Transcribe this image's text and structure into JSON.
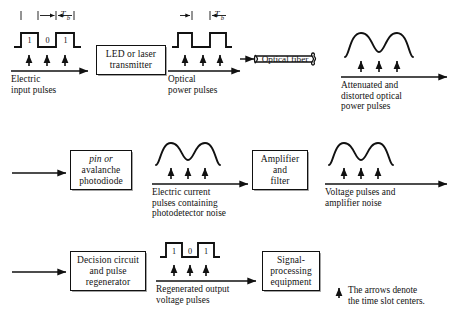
{
  "figure": {
    "note_text": "The arrows denote\nthe time slot centers.",
    "note_icon": "up-arrow-icon",
    "period_symbol": "T",
    "period_subscript": "b"
  },
  "stages": {
    "electric_input": {
      "caption": "Electric\ninput pulses",
      "bits": [
        "1",
        "0",
        "1"
      ],
      "waveform": "square-pulse-train",
      "has_bit_labels": true,
      "has_period_marker": true
    },
    "transmitter_box": {
      "label_lines": [
        "LED or laser",
        "transmitter"
      ]
    },
    "optical_power": {
      "caption": "Optical\npower pulses",
      "bits": [
        "",
        "",
        ""
      ],
      "waveform": "square-pulse-train",
      "has_bit_labels": false,
      "has_period_marker": true
    },
    "optical_fiber": {
      "label": "Optical fiber",
      "shape": "cylinder"
    },
    "attenuated_optical": {
      "caption": "Attenuated and\ndistorted optical\npower pulses",
      "waveform": "rounded-humps"
    },
    "photodiode_box": {
      "label_lines": [
        "pin or",
        "avalanche",
        "photodiode"
      ],
      "italic_word": "pin"
    },
    "electric_current": {
      "caption": "Electric current\npulses containing\nphotodetector noise",
      "waveform": "rounded-humps"
    },
    "amplifier_box": {
      "label_lines": [
        "Amplifier",
        "and",
        "filter"
      ]
    },
    "voltage_pulses": {
      "caption": "Voltage pulses and\namplifier noise",
      "waveform": "rounded-humps"
    },
    "decision_box": {
      "label_lines": [
        "Decision circuit",
        "and pulse",
        "regenerator"
      ]
    },
    "regenerated_output": {
      "caption": "Regenerated output\nvoltage pulses",
      "bits": [
        "1",
        "0",
        "1"
      ],
      "waveform": "square-pulse-train",
      "has_bit_labels": true,
      "has_period_marker": false
    },
    "signal_processing_box": {
      "label_lines": [
        "Signal-",
        "processing",
        "equipment"
      ]
    }
  },
  "colors": {
    "ink": "#111111",
    "background": "#ffffff",
    "box_shadow": "#9a9a9a"
  }
}
